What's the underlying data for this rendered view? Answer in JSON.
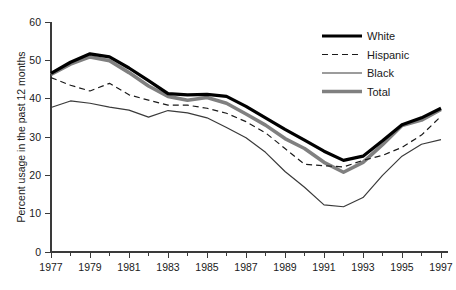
{
  "chart_data": {
    "type": "line",
    "title": "",
    "subtitle": "",
    "xlabel": "",
    "ylabel": "Percent usage in the past 12 months",
    "xlim": [
      1977,
      1997
    ],
    "ylim": [
      0,
      60
    ],
    "yticks": [
      0,
      10,
      20,
      30,
      40,
      50,
      60
    ],
    "ytick_labels": [
      "0",
      "10",
      "20",
      "30",
      "40",
      "50",
      "60"
    ],
    "xticks": [
      1977,
      1979,
      1981,
      1983,
      1985,
      1987,
      1989,
      1991,
      1993,
      1995,
      1997
    ],
    "xtick_labels": [
      "1977",
      "1979",
      "1981",
      "1983",
      "1985",
      "1987",
      "1989",
      "1991",
      "1993",
      "1995",
      "1997"
    ],
    "x_minor_ticks": [
      1978,
      1980,
      1982,
      1984,
      1986,
      1988,
      1990,
      1992,
      1994,
      1996
    ],
    "grid": false,
    "legend_position": "top-right",
    "x": [
      1977,
      1978,
      1979,
      1980,
      1981,
      1982,
      1983,
      1984,
      1985,
      1986,
      1987,
      1988,
      1989,
      1990,
      1991,
      1992,
      1993,
      1994,
      1995,
      1996,
      1997
    ],
    "series": [
      {
        "name": "White",
        "style": "thick-solid-black",
        "color": "#000000",
        "width": 3.2,
        "dash": "none",
        "values": [
          46.6,
          49.5,
          51.7,
          50.9,
          48.0,
          44.7,
          41.3,
          41.0,
          41.1,
          40.6,
          38.0,
          35.0,
          32.0,
          29.2,
          26.3,
          23.9,
          25.0,
          29.0,
          33.2,
          35.0,
          37.5
        ]
      },
      {
        "name": "Hispanic",
        "style": "dashed-black",
        "color": "#1a1a1a",
        "width": 1.2,
        "dash": "6,4",
        "values": [
          45.5,
          43.5,
          42.0,
          44.0,
          41.0,
          39.6,
          38.3,
          38.3,
          37.5,
          36.2,
          34.0,
          31.1,
          27.0,
          22.9,
          22.5,
          22.2,
          23.9,
          25.2,
          27.3,
          30.5,
          35.4
        ]
      },
      {
        "name": "Black",
        "style": "thin-solid-black",
        "color": "#3a3a3a",
        "width": 1.2,
        "dash": "none",
        "values": [
          37.7,
          39.4,
          38.8,
          37.8,
          37.0,
          35.2,
          36.9,
          36.3,
          35.0,
          32.5,
          29.8,
          26.0,
          21.0,
          16.9,
          12.3,
          11.8,
          14.2,
          20.0,
          25.0,
          28.1,
          29.3
        ]
      },
      {
        "name": "Total",
        "style": "thick-solid-gray",
        "color": "#808080",
        "width": 3.6,
        "dash": "none",
        "values": [
          46.3,
          49.0,
          50.9,
          49.9,
          46.8,
          43.3,
          40.6,
          39.6,
          40.3,
          38.8,
          36.0,
          33.1,
          29.6,
          27.0,
          23.4,
          20.8,
          23.4,
          28.0,
          33.0,
          34.4,
          37.2
        ]
      }
    ]
  },
  "legend": {
    "items": [
      {
        "label": "White"
      },
      {
        "label": "Hispanic"
      },
      {
        "label": "Black"
      },
      {
        "label": "Total"
      }
    ]
  }
}
